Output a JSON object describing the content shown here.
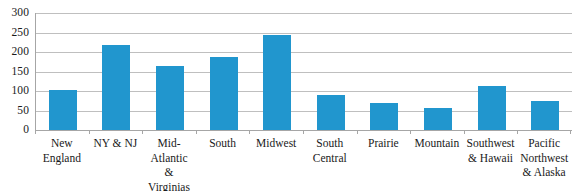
{
  "chart_data": {
    "type": "bar",
    "title": "",
    "subtitle": "",
    "xlabel": "",
    "ylabel": "",
    "ylim": [
      0,
      300
    ],
    "yticks": [
      300,
      250,
      200,
      150,
      100,
      50,
      0
    ],
    "grid": true,
    "legend": false,
    "legend_position": "none",
    "bar_color": "#2196CE",
    "gridline_color": "#BFBFBF",
    "axis_color": "#A6A6A6",
    "categories": [
      "New England",
      "NY & NJ",
      "Mid-Atlantic & Virginias",
      "South",
      "Midwest",
      "South Central",
      "Prairie",
      "Mountain",
      "Southwest & Hawaii",
      "Pacific Northwest & Alaska"
    ],
    "values": [
      102,
      219,
      163,
      187,
      243,
      90,
      68,
      57,
      113,
      75
    ],
    "series": [
      {
        "name": "",
        "values": [
          102,
          219,
          163,
          187,
          243,
          90,
          68,
          57,
          113,
          75
        ]
      }
    ]
  },
  "axis": {
    "y_tick_labels": [
      "300",
      "250",
      "200",
      "150",
      "100",
      "50",
      "0"
    ],
    "x_tick_labels": [
      "New England",
      "NY & NJ",
      "Mid-\nAtlantic\n& Virginias",
      "South",
      "Midwest",
      "South\nCentral",
      "Prairie",
      "Mountain",
      "Southwest\n& Hawaii",
      "Pacific\nNorthwest\n& Alaska"
    ]
  }
}
